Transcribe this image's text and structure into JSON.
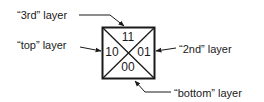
{
  "diagram": {
    "cells": {
      "top": "11",
      "left": "10",
      "right": "01",
      "bottom": "00"
    },
    "callouts": {
      "third": "“3rd” layer",
      "top": "“top” layer",
      "second": "“2nd” layer",
      "bottom": "“bottom” layer"
    },
    "colors": {
      "stroke": "#1a1a1a",
      "background": "#ffffff"
    }
  }
}
